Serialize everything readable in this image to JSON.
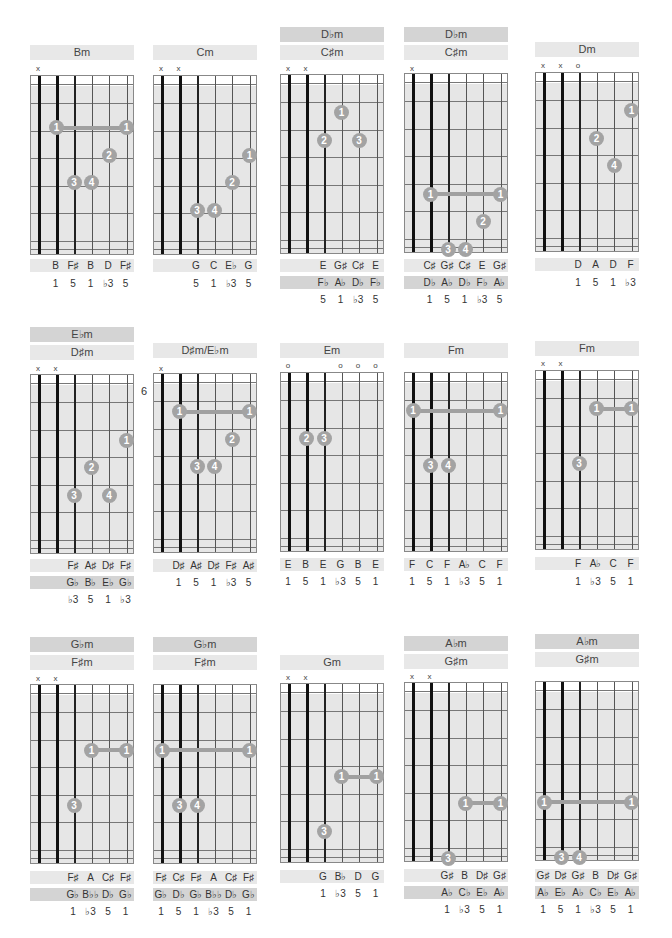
{
  "page": {
    "colors": {
      "dot": "#a3a3a3",
      "barre": "#a0a0a0",
      "header_dark": "#d4d4d4",
      "header_light": "#e8e8e8",
      "fretboard_shade": "#e6e6e6"
    }
  },
  "chords": [
    {
      "id": "bm",
      "headers": [
        "Bm"
      ],
      "marks": [
        "x",
        "",
        "",
        "",
        "",
        ""
      ],
      "dots": [
        {
          "s": 1,
          "f": 1,
          "n": "1"
        },
        {
          "s": 5,
          "f": 1,
          "n": "1"
        },
        {
          "s": 4,
          "f": 2,
          "n": "2"
        },
        {
          "s": 2,
          "f": 3,
          "n": "3"
        },
        {
          "s": 3,
          "f": 3,
          "n": "4"
        }
      ],
      "barre": {
        "from": 1,
        "to": 5,
        "f": 1
      },
      "note_rows": [
        [
          "",
          "B",
          "F♯",
          "B",
          "D",
          "F♯"
        ]
      ],
      "degrees": [
        "",
        "1",
        "5",
        "1",
        "♭3",
        "5"
      ]
    },
    {
      "id": "cm",
      "headers": [
        "Cm"
      ],
      "marks": [
        "x",
        "x",
        "",
        "",
        "",
        ""
      ],
      "dots": [
        {
          "s": 5,
          "f": 2,
          "n": "1"
        },
        {
          "s": 4,
          "f": 3,
          "n": "2"
        },
        {
          "s": 2,
          "f": 4,
          "n": "3"
        },
        {
          "s": 3,
          "f": 4,
          "n": "4"
        }
      ],
      "barre": null,
      "note_rows": [
        [
          "",
          "",
          "G",
          "C",
          "E♭",
          "G"
        ]
      ],
      "degrees": [
        "",
        "",
        "5",
        "1",
        "♭3",
        "5"
      ]
    },
    {
      "id": "dbm1",
      "headers": [
        "D♭m",
        "C♯m"
      ],
      "marks": [
        "x",
        "x",
        "",
        "",
        "",
        ""
      ],
      "dots": [
        {
          "s": 3,
          "f": 0.5,
          "n": "1"
        },
        {
          "s": 2,
          "f": 1.5,
          "n": "2"
        },
        {
          "s": 4,
          "f": 1.5,
          "n": "3"
        }
      ],
      "barre": null,
      "note_rows": [
        [
          "",
          "",
          "E",
          "G♯",
          "C♯",
          "E"
        ],
        [
          "",
          "",
          "F♭",
          "A♭",
          "D♭",
          "F♭"
        ]
      ],
      "degrees": [
        "",
        "",
        "5",
        "1",
        "♭3",
        "5"
      ]
    },
    {
      "id": "dbm2",
      "headers": [
        "D♭m",
        "C♯m"
      ],
      "marks": [
        "x",
        "",
        "",
        "",
        "",
        ""
      ],
      "dots": [
        {
          "s": 1,
          "f": 3.5,
          "n": "1"
        },
        {
          "s": 5,
          "f": 3.5,
          "n": "1"
        },
        {
          "s": 4,
          "f": 4.5,
          "n": "2"
        },
        {
          "s": 2,
          "f": 5.5,
          "n": "3"
        },
        {
          "s": 3,
          "f": 5.5,
          "n": "4"
        }
      ],
      "barre": {
        "from": 1,
        "to": 5,
        "f": 3.5
      },
      "note_rows": [
        [
          "",
          "C♯",
          "G♯",
          "C♯",
          "E",
          "G♯"
        ],
        [
          "",
          "D♭",
          "A♭",
          "D♭",
          "F♭",
          "A♭"
        ]
      ],
      "degrees": [
        "",
        "1",
        "5",
        "1",
        "♭3",
        "5"
      ]
    },
    {
      "id": "dm",
      "headers": [
        "Dm"
      ],
      "marks": [
        "x",
        "x",
        "o",
        "",
        "",
        ""
      ],
      "dots": [
        {
          "s": 5,
          "f": 0.5,
          "n": "1"
        },
        {
          "s": 3,
          "f": 1.5,
          "n": "2"
        },
        {
          "s": 4,
          "f": 2.5,
          "n": "4"
        }
      ],
      "barre": null,
      "note_rows": [
        [
          "",
          "",
          "D",
          "A",
          "D",
          "F"
        ]
      ],
      "degrees": [
        "",
        "",
        "1",
        "5",
        "1",
        "♭3"
      ]
    },
    {
      "id": "ebm1",
      "headers": [
        "E♭m",
        "D♯m"
      ],
      "marks": [
        "x",
        "x",
        "",
        "",
        "",
        ""
      ],
      "dots": [
        {
          "s": 5,
          "f": 1.5,
          "n": "1"
        },
        {
          "s": 3,
          "f": 2.5,
          "n": "2"
        },
        {
          "s": 2,
          "f": 3.5,
          "n": "3"
        },
        {
          "s": 4,
          "f": 3.5,
          "n": "4"
        }
      ],
      "barre": null,
      "note_rows": [
        [
          "",
          "",
          "F♯",
          "A♯",
          "D♯",
          "F♯"
        ],
        [
          "",
          "",
          "G♭",
          "B♭",
          "E♭",
          "G♭"
        ]
      ],
      "degrees": [
        "",
        "",
        "♭3",
        "5",
        "1",
        "♭3"
      ]
    },
    {
      "id": "dsm",
      "headers": [
        "D♯m/E♭m"
      ],
      "marks": [
        "x",
        "",
        "",
        "",
        "",
        ""
      ],
      "fret_label": "6",
      "dots": [
        {
          "s": 1,
          "f": 0.5,
          "n": "1"
        },
        {
          "s": 5,
          "f": 0.5,
          "n": "1"
        },
        {
          "s": 4,
          "f": 1.5,
          "n": "2"
        },
        {
          "s": 2,
          "f": 2.5,
          "n": "3"
        },
        {
          "s": 3,
          "f": 2.5,
          "n": "4"
        }
      ],
      "barre": {
        "from": 1,
        "to": 5,
        "f": 0.5
      },
      "note_rows": [
        [
          "",
          "D♯",
          "A♯",
          "D♯",
          "F♯",
          "A♯"
        ]
      ],
      "degrees": [
        "",
        "1",
        "5",
        "1",
        "♭3",
        "5"
      ]
    },
    {
      "id": "em",
      "headers": [
        "Em"
      ],
      "marks": [
        "o",
        "",
        "",
        "o",
        "o",
        "o"
      ],
      "dots": [
        {
          "s": 1,
          "f": 1.5,
          "n": "2"
        },
        {
          "s": 2,
          "f": 1.5,
          "n": "3"
        }
      ],
      "barre": null,
      "note_rows": [
        [
          "E",
          "B",
          "E",
          "G",
          "B",
          "E"
        ]
      ],
      "degrees": [
        "1",
        "5",
        "1",
        "♭3",
        "5",
        "1"
      ]
    },
    {
      "id": "fm1",
      "headers": [
        "Fm"
      ],
      "marks": [
        "",
        "",
        "",
        "",
        "",
        ""
      ],
      "dots": [
        {
          "s": 0,
          "f": 0.5,
          "n": "1"
        },
        {
          "s": 5,
          "f": 0.5,
          "n": "1"
        },
        {
          "s": 1,
          "f": 2.5,
          "n": "3"
        },
        {
          "s": 2,
          "f": 2.5,
          "n": "4"
        }
      ],
      "barre": {
        "from": 0,
        "to": 5,
        "f": 0.5
      },
      "note_rows": [
        [
          "F",
          "C",
          "F",
          "A♭",
          "C",
          "F"
        ]
      ],
      "degrees": [
        "1",
        "5",
        "1",
        "♭3",
        "5",
        "1"
      ]
    },
    {
      "id": "fm2",
      "headers": [
        "Fm"
      ],
      "marks": [
        "x",
        "x",
        "",
        "",
        "",
        ""
      ],
      "dots": [
        {
          "s": 3,
          "f": 0.5,
          "n": "1"
        },
        {
          "s": 5,
          "f": 0.5,
          "n": "1"
        },
        {
          "s": 2,
          "f": 2.5,
          "n": "3"
        }
      ],
      "barre": {
        "from": 3,
        "to": 5,
        "f": 0.5
      },
      "note_rows": [
        [
          "",
          "",
          "F",
          "A♭",
          "C",
          "F"
        ]
      ],
      "degrees": [
        "",
        "",
        "1",
        "♭3",
        "5",
        "1"
      ]
    },
    {
      "id": "gbm1",
      "headers": [
        "G♭m",
        "F♯m"
      ],
      "marks": [
        "x",
        "x",
        "",
        "",
        "",
        ""
      ],
      "dots": [
        {
          "s": 3,
          "f": 1.5,
          "n": "1"
        },
        {
          "s": 5,
          "f": 1.5,
          "n": "1"
        },
        {
          "s": 2,
          "f": 3.5,
          "n": "3"
        }
      ],
      "barre": {
        "from": 3,
        "to": 5,
        "f": 1.5
      },
      "note_rows": [
        [
          "",
          "",
          "F♯",
          "A",
          "C♯",
          "F♯"
        ],
        [
          "",
          "",
          "G♭",
          "B♭♭",
          "D♭",
          "G♭"
        ]
      ],
      "degrees": [
        "",
        "",
        "1",
        "♭3",
        "5",
        "1"
      ]
    },
    {
      "id": "gbm2",
      "headers": [
        "G♭m",
        "F♯m"
      ],
      "marks": [
        "",
        "",
        "",
        "",
        "",
        ""
      ],
      "dots": [
        {
          "s": 0,
          "f": 1.5,
          "n": "1"
        },
        {
          "s": 5,
          "f": 1.5,
          "n": "1"
        },
        {
          "s": 1,
          "f": 3.5,
          "n": "3"
        },
        {
          "s": 2,
          "f": 3.5,
          "n": "4"
        }
      ],
      "barre": {
        "from": 0,
        "to": 5,
        "f": 1.5
      },
      "note_rows": [
        [
          "F♯",
          "C♯",
          "F♯",
          "A",
          "C♯",
          "F♯"
        ],
        [
          "G♭",
          "D♭",
          "G♭",
          "B♭♭",
          "D♭",
          "G♭"
        ]
      ],
      "degrees": [
        "1",
        "5",
        "1",
        "♭3",
        "5",
        "1"
      ]
    },
    {
      "id": "gm",
      "headers": [
        "Gm"
      ],
      "marks": [
        "x",
        "x",
        "",
        "",
        "",
        ""
      ],
      "dots": [
        {
          "s": 3,
          "f": 2.5,
          "n": "1"
        },
        {
          "s": 5,
          "f": 2.5,
          "n": "1"
        },
        {
          "s": 2,
          "f": 4.5,
          "n": "3"
        }
      ],
      "barre": {
        "from": 3,
        "to": 5,
        "f": 2.5
      },
      "note_rows": [
        [
          "",
          "",
          "G",
          "B♭",
          "D",
          "G"
        ]
      ],
      "degrees": [
        "",
        "",
        "1",
        "♭3",
        "5",
        "1"
      ]
    },
    {
      "id": "abm1",
      "headers": [
        "A♭m",
        "G♯m"
      ],
      "marks": [
        "x",
        "x",
        "",
        "",
        "",
        ""
      ],
      "dots": [
        {
          "s": 3,
          "f": 3.5,
          "n": "1"
        },
        {
          "s": 5,
          "f": 3.5,
          "n": "1"
        },
        {
          "s": 2,
          "f": 5.5,
          "n": "3"
        }
      ],
      "barre": {
        "from": 3,
        "to": 5,
        "f": 3.5
      },
      "note_rows": [
        [
          "",
          "",
          "G♯",
          "B",
          "D♯",
          "G♯"
        ],
        [
          "",
          "",
          "A♭",
          "C♭",
          "E♭",
          "A♭"
        ]
      ],
      "degrees": [
        "",
        "",
        "1",
        "♭3",
        "5",
        "1"
      ]
    },
    {
      "id": "abm2",
      "headers": [
        "A♭m",
        "G♯m"
      ],
      "marks": [
        "",
        "",
        "",
        "",
        "",
        ""
      ],
      "dots": [
        {
          "s": 0,
          "f": 3.5,
          "n": "1"
        },
        {
          "s": 5,
          "f": 3.5,
          "n": "1"
        },
        {
          "s": 1,
          "f": 5.5,
          "n": "3"
        },
        {
          "s": 2,
          "f": 5.5,
          "n": "4"
        }
      ],
      "barre": {
        "from": 0,
        "to": 5,
        "f": 3.5
      },
      "note_rows": [
        [
          "G♯",
          "D♯",
          "G♯",
          "B",
          "D♯",
          "G♯"
        ],
        [
          "A♭",
          "E♭",
          "A♭",
          "C♭",
          "E♭",
          "A♭"
        ]
      ],
      "degrees": [
        "1",
        "5",
        "1",
        "♭3",
        "5",
        "1"
      ]
    }
  ],
  "layout": {
    "cols": [
      30,
      153,
      280,
      404,
      535
    ],
    "chords": [
      {
        "col": 0,
        "hdr_top": [
          45
        ],
        "marks_top": 64,
        "board_top": 75,
        "notes_top": [
          259
        ],
        "deg_top": 277
      },
      {
        "col": 1,
        "hdr_top": [
          45
        ],
        "marks_top": 64,
        "board_top": 75,
        "notes_top": [
          259
        ],
        "deg_top": 277
      },
      {
        "col": 2,
        "hdr_top": [
          27,
          45
        ],
        "marks_top": 64,
        "board_top": 74,
        "notes_top": [
          259,
          276
        ],
        "deg_top": 293
      },
      {
        "col": 3,
        "hdr_top": [
          27,
          45
        ],
        "marks_top": 64,
        "board_top": 73,
        "notes_top": [
          259,
          276
        ],
        "deg_top": 293
      },
      {
        "col": 4,
        "hdr_top": [
          42
        ],
        "marks_top": 61,
        "board_top": 72,
        "notes_top": [
          258
        ],
        "deg_top": 276
      },
      {
        "col": 0,
        "hdr_top": [
          327,
          345
        ],
        "marks_top": 364,
        "board_top": 374,
        "notes_top": [
          559,
          576
        ],
        "deg_top": 593
      },
      {
        "col": 1,
        "hdr_top": [
          343
        ],
        "marks_top": 364,
        "board_top": 373,
        "notes_top": [
          559
        ],
        "deg_top": 576
      },
      {
        "col": 2,
        "hdr_top": [
          343
        ],
        "marks_top": 361,
        "board_top": 372,
        "notes_top": [
          558
        ],
        "deg_top": 575
      },
      {
        "col": 3,
        "hdr_top": [
          343
        ],
        "marks_top": 361,
        "board_top": 372,
        "notes_top": [
          558
        ],
        "deg_top": 575
      },
      {
        "col": 4,
        "hdr_top": [
          341
        ],
        "marks_top": 359,
        "board_top": 370,
        "notes_top": [
          557
        ],
        "deg_top": 575
      },
      {
        "col": 0,
        "hdr_top": [
          637,
          655
        ],
        "marks_top": 674,
        "board_top": 684,
        "notes_top": [
          871,
          888
        ],
        "deg_top": 905
      },
      {
        "col": 1,
        "hdr_top": [
          637,
          655
        ],
        "marks_top": 674,
        "board_top": 684,
        "notes_top": [
          871,
          888
        ],
        "deg_top": 905
      },
      {
        "col": 2,
        "hdr_top": [
          655
        ],
        "marks_top": 673,
        "board_top": 683,
        "notes_top": [
          870
        ],
        "deg_top": 887
      },
      {
        "col": 3,
        "hdr_top": [
          636,
          654
        ],
        "marks_top": 672,
        "board_top": 682,
        "notes_top": [
          869,
          886
        ],
        "deg_top": 903
      },
      {
        "col": 4,
        "hdr_top": [
          634,
          652
        ],
        "marks_top": 0,
        "board_top": 681,
        "notes_top": [
          869,
          886
        ],
        "deg_top": 903
      }
    ]
  }
}
